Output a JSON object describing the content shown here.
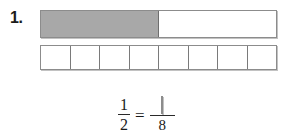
{
  "problem": {
    "number_label": "1.",
    "type": "equivalent-fraction-bar-model",
    "halves_bar": {
      "total_segments": 2,
      "shaded_segments": 1,
      "segments": [
        {
          "state": "shaded"
        },
        {
          "state": "unshaded"
        }
      ]
    },
    "eighths_bar": {
      "total_segments": 8,
      "shaded_segments": 0,
      "segments": [
        {
          "state": "unshaded"
        },
        {
          "state": "unshaded"
        },
        {
          "state": "unshaded"
        },
        {
          "state": "unshaded"
        },
        {
          "state": "unshaded"
        },
        {
          "state": "unshaded"
        },
        {
          "state": "unshaded"
        },
        {
          "state": "unshaded"
        }
      ]
    },
    "equation": {
      "left_fraction": {
        "numerator": "1",
        "denominator": "2"
      },
      "equals": "=",
      "right_fraction": {
        "numerator_value": "",
        "numerator_placeholder": "",
        "denominator": "8"
      }
    }
  },
  "colors": {
    "shaded_fill": "#a8a8a8",
    "unshaded_fill": "#ffffff",
    "bar_outline": "#8c8c8c",
    "divider": "#7a7a7a",
    "text": "#1a1a1a",
    "page_background": "#ffffff"
  }
}
